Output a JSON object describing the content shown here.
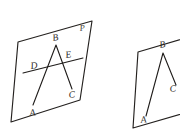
{
  "image": {
    "kind": "hand-drawn-geometry-diagram",
    "width": 180,
    "height": 135,
    "background_color": "#ffffff",
    "ink_color": "#24211f"
  },
  "figures": [
    {
      "id": "figure-left",
      "description": "Parallelogram representing plane P containing polyline A-B-C and transversal line through D and E",
      "plane_label": "P",
      "plane_outline": {
        "name": "parallelogram-plane-p",
        "points": "18,42 92,21 80,100 11,122"
      },
      "polyline": {
        "name": "polyline-abc",
        "points": "33,105 56,45 72,89"
      },
      "transversal": {
        "name": "line-de",
        "points": "23,73 83,58"
      },
      "labels": [
        {
          "text": "P",
          "x": 80,
          "y": 31,
          "name": "label-p"
        },
        {
          "text": "B",
          "x": 53,
          "y": 41,
          "name": "label-b"
        },
        {
          "text": "E",
          "x": 66,
          "y": 58,
          "name": "label-e"
        },
        {
          "text": "D",
          "x": 31,
          "y": 69,
          "name": "label-d"
        },
        {
          "text": "C",
          "x": 69,
          "y": 98,
          "name": "label-c"
        },
        {
          "text": "A",
          "x": 30,
          "y": 116,
          "name": "label-a"
        }
      ]
    },
    {
      "id": "figure-right",
      "description": "Second parallelogram plane with polyline A-B-C, cropped at the right edge of the image",
      "plane_label": "",
      "plane_outline": {
        "name": "parallelogram-plane-right",
        "points": "138,52 196,35 188,112 133,128"
      },
      "polyline": {
        "name": "polyline-abc-right",
        "points": "146,116 163,53 176,85"
      },
      "transversal": null,
      "labels": [
        {
          "text": "B",
          "x": 160,
          "y": 48,
          "name": "label-b-right"
        },
        {
          "text": "C",
          "x": 170,
          "y": 92,
          "name": "label-c-right"
        },
        {
          "text": "A",
          "x": 141,
          "y": 123,
          "name": "label-a-right"
        }
      ]
    }
  ]
}
